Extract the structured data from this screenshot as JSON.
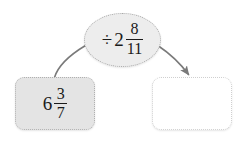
{
  "diagram": {
    "type": "function-machine-flow",
    "background_color": "#ffffff",
    "line_color": "#7a7a7a",
    "text_color": "#1a1a1a"
  },
  "input_node": {
    "name": "input-value",
    "fill_color": "#e4e4e4",
    "border_color": "#b0b0b0",
    "whole": "6",
    "numerator": "3",
    "denominator": "7",
    "full_text": "6 3/7"
  },
  "operation_node": {
    "name": "operation",
    "fill_color": "#ededed",
    "border_color": "#a8a8a8",
    "operator": "÷",
    "whole": "2",
    "numerator": "8",
    "denominator": "11",
    "full_text": "÷ 2 8/11"
  },
  "output_node": {
    "name": "output-value",
    "fill_color": "#ffffff",
    "border_color": "#cfcfcf",
    "value": "",
    "placeholder": ""
  },
  "connectors": [
    {
      "name": "input-to-operation",
      "from": "input-node",
      "to": "operation-node",
      "arrowhead": false
    },
    {
      "name": "operation-to-output",
      "from": "operation-node",
      "to": "output-node",
      "arrowhead": true
    }
  ]
}
